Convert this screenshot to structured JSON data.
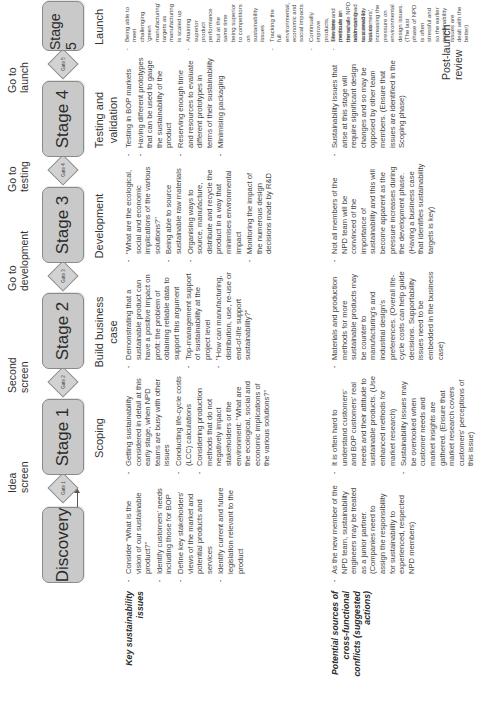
{
  "flow": {
    "gates": [
      {
        "label": "Idea screen",
        "gate_text": "Gate 1"
      },
      {
        "label": "Second screen",
        "gate_text": "Gate 2"
      },
      {
        "label": "Go to development",
        "gate_text": "Gate 3"
      },
      {
        "label": "Go to testing",
        "gate_text": "Gate 4"
      },
      {
        "label": "Go to launch",
        "gate_text": "Gate 5"
      }
    ],
    "stages": [
      {
        "name": "Discovery",
        "phase": ""
      },
      {
        "name": "Stage 1",
        "phase": "Scoping"
      },
      {
        "name": "Stage 2",
        "phase": "Build business case"
      },
      {
        "name": "Stage 3",
        "phase": "Development"
      },
      {
        "name": "Stage 4",
        "phase": "Testing and validation"
      },
      {
        "name": "Stage 5",
        "phase": "Launch"
      }
    ],
    "end_label": "Post-launch review"
  },
  "rows": [
    {
      "label": "Key sustainability issues",
      "cells": [
        [
          "Consider \"What is the vision of our sustainable product?\"",
          "Identify customers' needs including those for BOP",
          "Define key stakeholders' views of the market and potential products and services",
          "Identify current and future legislation relevant to the product"
        ],
        [
          "Getting sustainability considered in detail at this early stage, when NPD teams are busy with other issues",
          "Conducting life-cycle costs (LCC) calculations",
          "Considering production methods that do not negatively impact stakeholders or the environment: \"What are the ecological, social and economic implications of the various solutions?\""
        ],
        [
          "Demonstrating that a sustainable product can have a positive impact on profit: the problem of obtaining reliable data to support this argument",
          "Top-management support of sustainability at the project level",
          "\"How can manufacturing, distribution, use, re-use or end-of-life support sustainability?\""
        ],
        [
          "\"What are the ecological, social and economic implications of the various solutions?\"",
          "Being able to source sustainable raw materials",
          "Organising ways to source, manufacture, distribute and recycle the product in a way that minimises environmental impact",
          "Monitoring the impact of the numerous design decisions made by R&D"
        ],
        [
          "Testing in BOP markets",
          "Having different prototypes that can be used to gauge the sustainability of the product",
          "Reserving enough time and resources to evaluate different prototypes in terms of their sustainability",
          "Minimising packaging"
        ],
        [
          "Being able to meet challenging 'green manufacturing' targets as manufacturing is scaled up",
          "Attaining superior product performance but at the same time being superior to competitors on sustainability issues",
          "Tracking the full environmental, economic and social impacts",
          "Continually improve products, services and methods in terms of addressing sustainability issues"
        ]
      ]
    },
    {
      "label": "Potential sources of cross-functional conflicts (suggested actions)",
      "cells": [
        [
          "As the new member of the NPD team, sustainability engineers may be treated as a junior partner. (Companies need to assign the responsibility for sustainability to experienced, respected NPD members)"
        ],
        [
          "It is often hard to understand customers' and BOP customers' real needs and their attitude to sustainable products. (Use enhanced methods for market research)",
          "Sustainability issues may be overlooked when customer needs and market insights are gathered. (Ensure that market research covers customers' perceptions of this issue)"
        ],
        [
          "Materials and production methods for more sustainable products may be counter to manufacturing's and industrial design's preferences. (Overall life-cycle costs can help guide decisions. Supportability issues need to be embedded in the business case)"
        ],
        [
          "Not all members of the NPD team will be convinced of the importance of sustainability and this will become apparent as the pressure increases during the development phase. (Having a business case that identifies sustainability targets is key)"
        ],
        [
          "Sustainability issues that arise at this stage will require significant design changes and so may be opposed by other team members. (Ensure that issues are identified in the Scoping phase)"
        ],
        [
          "The time pressure on the whole NPD team can lead to a need to 'cut corners', increasing the pressure on environmental design issues. (The last phase of NPD is often stressful and so the earlier sustainability issues are dealt with the better)"
        ]
      ]
    }
  ],
  "colors": {
    "stage_fill": "#c9c9c9",
    "stage_border": "#8a8a8a",
    "text": "#3a3a3a"
  }
}
